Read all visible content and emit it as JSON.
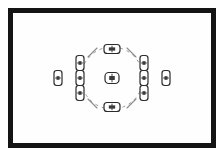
{
  "scene": {
    "title": "Camera Viewfinder AF Point Layout",
    "kind": "camera-viewfinder-diagram",
    "canvas_width": 224,
    "canvas_height": 156
  },
  "colors": {
    "frame_border": "#141414",
    "background": "#ffffff",
    "viewfinder_field": "#fefefe",
    "af_point_stroke": "#2b2b2b",
    "af_point_fill": "#ffffff",
    "af_point_core": "#3a3a3a",
    "spot_circle_stroke": "#9a9a9a",
    "arc_stroke": "#8c8c8c"
  },
  "frame": {
    "label": "viewfinder-frame",
    "x": 8,
    "y": 8,
    "width": 208,
    "height": 140,
    "border_width": 5
  },
  "spot_circle": {
    "label": "spot-metering-circle",
    "center_x": 112,
    "center_y": 78,
    "radius": 31,
    "dash": "3 4",
    "stroke_width": 1
  },
  "corner_arcs": {
    "label": "zone-corner-arcs",
    "stroke_width": 1.1,
    "segments": [
      {
        "name": "arc-top-left",
        "x1": 88,
        "y1": 57,
        "x2": 97,
        "y2": 48
      },
      {
        "name": "arc-top-right",
        "x1": 127,
        "y1": 48,
        "x2": 136,
        "y2": 57
      },
      {
        "name": "arc-bottom-left",
        "x1": 88,
        "y1": 99,
        "x2": 97,
        "y2": 108
      },
      {
        "name": "arc-bottom-right",
        "x1": 127,
        "y1": 108,
        "x2": 136,
        "y2": 99
      }
    ]
  },
  "af_points": {
    "label": "autofocus-point-array",
    "count": 11,
    "point_stroke_width": 1.2,
    "items": [
      {
        "name": "af-point-far-left",
        "id": "L-OUT",
        "cx": 58,
        "cy": 78,
        "orientation": "vertical",
        "w": 8,
        "h": 15,
        "selected": false
      },
      {
        "name": "af-point-left-upper",
        "id": "L-UP",
        "cx": 80,
        "cy": 63,
        "orientation": "vertical",
        "w": 8,
        "h": 15,
        "selected": false
      },
      {
        "name": "af-point-left-middle",
        "id": "L-MID",
        "cx": 80,
        "cy": 78,
        "orientation": "vertical",
        "w": 8,
        "h": 15,
        "selected": false
      },
      {
        "name": "af-point-left-lower",
        "id": "L-LOW",
        "cx": 80,
        "cy": 93,
        "orientation": "vertical",
        "w": 8,
        "h": 15,
        "selected": false
      },
      {
        "name": "af-point-top-center",
        "id": "T-CTR",
        "cx": 112,
        "cy": 49,
        "orientation": "horizontal",
        "w": 16,
        "h": 9,
        "selected": false
      },
      {
        "name": "af-point-center",
        "id": "CTR",
        "cx": 112,
        "cy": 78,
        "orientation": "horizontal",
        "w": 14,
        "h": 11,
        "selected": true
      },
      {
        "name": "af-point-bottom-center",
        "id": "B-CTR",
        "cx": 112,
        "cy": 107,
        "orientation": "horizontal",
        "w": 16,
        "h": 9,
        "selected": false
      },
      {
        "name": "af-point-right-upper",
        "id": "R-UP",
        "cx": 144,
        "cy": 63,
        "orientation": "vertical",
        "w": 8,
        "h": 15,
        "selected": false
      },
      {
        "name": "af-point-right-middle",
        "id": "R-MID",
        "cx": 144,
        "cy": 78,
        "orientation": "vertical",
        "w": 8,
        "h": 15,
        "selected": false
      },
      {
        "name": "af-point-right-lower",
        "id": "R-LOW",
        "cx": 144,
        "cy": 93,
        "orientation": "vertical",
        "w": 8,
        "h": 15,
        "selected": false
      },
      {
        "name": "af-point-far-right",
        "id": "R-OUT",
        "cx": 166,
        "cy": 78,
        "orientation": "vertical",
        "w": 8,
        "h": 15,
        "selected": false
      }
    ]
  }
}
